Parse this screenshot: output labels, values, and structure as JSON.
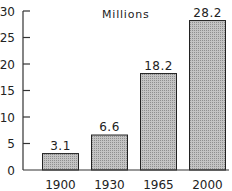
{
  "chart_data": {
    "type": "bar",
    "title": "Millions",
    "xlabel": "",
    "ylabel": "",
    "categories": [
      "1900",
      "1930",
      "1965",
      "2000"
    ],
    "values": [
      3.1,
      6.6,
      18.2,
      28.2
    ],
    "data_labels": [
      "3.1",
      "6.6",
      "18.2",
      "28.2"
    ],
    "yticks": [
      0,
      5,
      10,
      15,
      20,
      25,
      30
    ],
    "ytick_labels": [
      "0",
      "5",
      "10",
      "15",
      "20",
      "25",
      "30"
    ],
    "ylim": [
      0,
      30
    ],
    "grid": false,
    "legend": null,
    "bar_fill": "#b8b8b8",
    "bar_stroke": "#222222"
  }
}
